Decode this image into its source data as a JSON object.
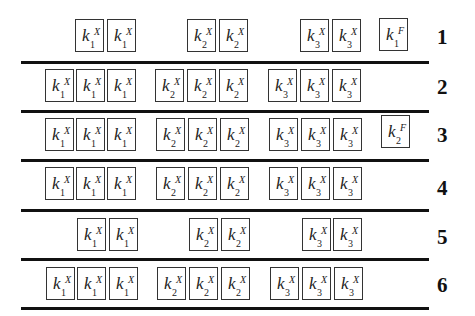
{
  "slots": {
    "k1X_a": 45,
    "k1X_b": 76,
    "k1X_c": 107,
    "k2X_a": 156,
    "k2X_b": 188,
    "k2X_c": 220,
    "k3X_a": 269,
    "k3X_b": 301,
    "k3X_c": 333,
    "F": 380
  },
  "rows": [
    {
      "number": "1",
      "boxes": [
        {
          "base": "k",
          "sub": "1",
          "sup": "X"
        },
        {
          "base": "k",
          "sub": "1",
          "sup": "X"
        },
        {
          "base": "k",
          "sub": "2",
          "sup": "X"
        },
        {
          "base": "k",
          "sub": "2",
          "sup": "X"
        },
        {
          "base": "k",
          "sub": "3",
          "sup": "X"
        },
        {
          "base": "k",
          "sub": "3",
          "sup": "X"
        },
        {
          "base": "k",
          "sub": "1",
          "sup": "F"
        }
      ]
    },
    {
      "number": "2",
      "boxes": [
        {
          "base": "k",
          "sub": "1",
          "sup": "X"
        },
        {
          "base": "k",
          "sub": "1",
          "sup": "X"
        },
        {
          "base": "k",
          "sub": "1",
          "sup": "X"
        },
        {
          "base": "k",
          "sub": "2",
          "sup": "X"
        },
        {
          "base": "k",
          "sub": "2",
          "sup": "X"
        },
        {
          "base": "k",
          "sub": "2",
          "sup": "X"
        },
        {
          "base": "k",
          "sub": "3",
          "sup": "X"
        },
        {
          "base": "k",
          "sub": "3",
          "sup": "X"
        },
        {
          "base": "k",
          "sub": "3",
          "sup": "X"
        }
      ]
    },
    {
      "number": "3",
      "boxes": [
        {
          "base": "k",
          "sub": "1",
          "sup": "X"
        },
        {
          "base": "k",
          "sub": "1",
          "sup": "X"
        },
        {
          "base": "k",
          "sub": "1",
          "sup": "X"
        },
        {
          "base": "k",
          "sub": "2",
          "sup": "X"
        },
        {
          "base": "k",
          "sub": "2",
          "sup": "X"
        },
        {
          "base": "k",
          "sub": "2",
          "sup": "X"
        },
        {
          "base": "k",
          "sub": "3",
          "sup": "X"
        },
        {
          "base": "k",
          "sub": "3",
          "sup": "X"
        },
        {
          "base": "k",
          "sub": "3",
          "sup": "X"
        },
        {
          "base": "k",
          "sub": "2",
          "sup": "F"
        }
      ]
    },
    {
      "number": "4",
      "boxes": [
        {
          "base": "k",
          "sub": "1",
          "sup": "X"
        },
        {
          "base": "k",
          "sub": "1",
          "sup": "X"
        },
        {
          "base": "k",
          "sub": "1",
          "sup": "X"
        },
        {
          "base": "k",
          "sub": "2",
          "sup": "X"
        },
        {
          "base": "k",
          "sub": "2",
          "sup": "X"
        },
        {
          "base": "k",
          "sub": "2",
          "sup": "X"
        },
        {
          "base": "k",
          "sub": "3",
          "sup": "X"
        },
        {
          "base": "k",
          "sub": "3",
          "sup": "X"
        },
        {
          "base": "k",
          "sub": "3",
          "sup": "X"
        }
      ]
    },
    {
      "number": "5",
      "boxes": [
        {
          "base": "k",
          "sub": "1",
          "sup": "X"
        },
        {
          "base": "k",
          "sub": "1",
          "sup": "X"
        },
        {
          "base": "k",
          "sub": "2",
          "sup": "X"
        },
        {
          "base": "k",
          "sub": "2",
          "sup": "X"
        },
        {
          "base": "k",
          "sub": "3",
          "sup": "X"
        },
        {
          "base": "k",
          "sub": "3",
          "sup": "X"
        }
      ]
    },
    {
      "number": "6",
      "boxes": [
        {
          "base": "k",
          "sub": "1",
          "sup": "X"
        },
        {
          "base": "k",
          "sub": "1",
          "sup": "X"
        },
        {
          "base": "k",
          "sub": "1",
          "sup": "X"
        },
        {
          "base": "k",
          "sub": "2",
          "sup": "X"
        },
        {
          "base": "k",
          "sub": "2",
          "sup": "X"
        },
        {
          "base": "k",
          "sub": "2",
          "sup": "X"
        },
        {
          "base": "k",
          "sub": "3",
          "sup": "X"
        },
        {
          "base": "k",
          "sub": "3",
          "sup": "X"
        },
        {
          "base": "k",
          "sub": "3",
          "sup": "X"
        }
      ]
    }
  ]
}
